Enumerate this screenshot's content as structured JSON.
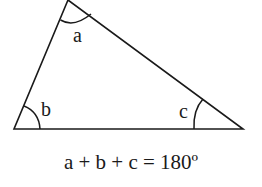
{
  "diagram": {
    "stroke_color": "#1a1a1a",
    "vertices": {
      "top": [
        68,
        0
      ],
      "bottom_left": [
        14,
        129
      ],
      "bottom_right": [
        243,
        129
      ]
    },
    "angles": [
      {
        "id": "a",
        "label": "a",
        "vertex": "top"
      },
      {
        "id": "b",
        "label": "b",
        "vertex": "bottom_left"
      },
      {
        "id": "c",
        "label": "c",
        "vertex": "bottom_right"
      }
    ],
    "equation": "a + b + c = 180º"
  }
}
